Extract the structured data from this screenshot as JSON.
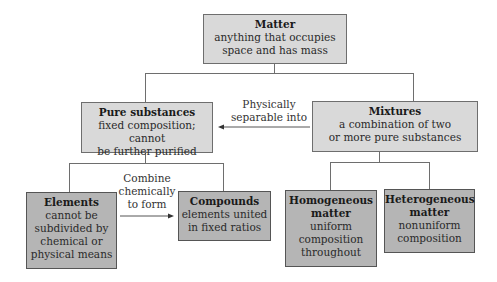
{
  "nodes": {
    "matter": {
      "title": "Matter",
      "lines": [
        "anything that occupies",
        "space and has mass"
      ]
    },
    "pure_substances": {
      "title": "Pure substances",
      "lines": [
        "fixed composition; cannot",
        "be further purified"
      ]
    },
    "mixtures": {
      "title": "Mixtures",
      "lines": [
        "a combination of two",
        "or more pure substances"
      ]
    },
    "elements": {
      "title": "Elements",
      "lines": [
        "cannot be",
        "subdivided by",
        "chemical or",
        "physical means"
      ]
    },
    "compounds": {
      "title": "Compounds",
      "lines": [
        "elements united",
        "in fixed ratios"
      ]
    },
    "homogeneous": {
      "title_lines": [
        "Homogeneous",
        "matter"
      ],
      "lines": [
        "uniform",
        "composition",
        "throughout"
      ]
    },
    "heterogeneous": {
      "title_lines": [
        "Heterogeneous",
        "matter"
      ],
      "lines": [
        "nonuniform",
        "composition"
      ]
    }
  },
  "edges": {
    "mixtures_to_pure": {
      "lines": [
        "Physically",
        "separable into"
      ]
    },
    "elements_to_compounds": {
      "lines": [
        "Combine",
        "chemically",
        "to form"
      ]
    }
  },
  "colors": {
    "light_box": "#d9d9d9",
    "dark_box": "#b5b5b5",
    "line": "#6e6e6e"
  }
}
